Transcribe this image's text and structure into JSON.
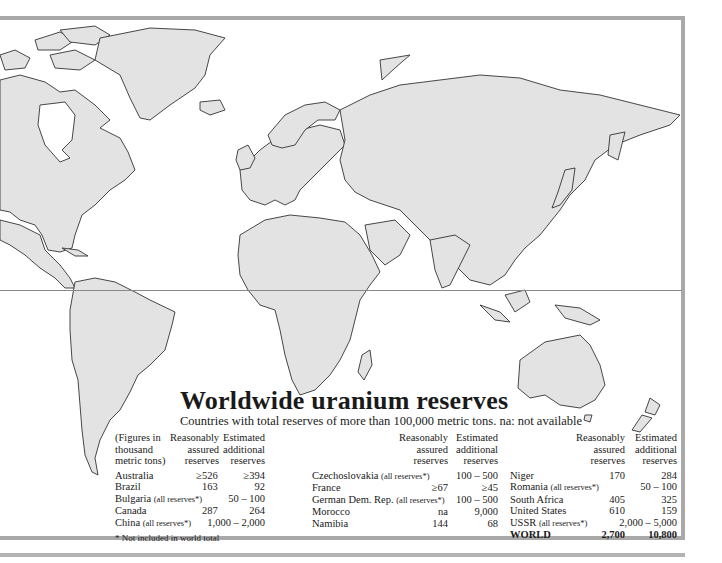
{
  "map": {
    "title": "Worldwide uranium reserves",
    "subtitle": "Countries with total reserves of more than 100,000 metric tons. na: not available",
    "fill_color": "#e3e3e3",
    "border_color": "#333333",
    "frame_color": "#a9a9a9"
  },
  "table": {
    "units_note": [
      "(Figures in",
      "thousand",
      "metric tons)"
    ],
    "col_headers": {
      "assured": [
        "Reasonably",
        "assured",
        "reserves"
      ],
      "additional": [
        "Estimated",
        "additional",
        "reserves"
      ]
    },
    "groups": [
      {
        "rows": [
          {
            "country": "Australia",
            "note": "",
            "assured": "≥526",
            "additional": "≥394"
          },
          {
            "country": "Brazil",
            "note": "",
            "assured": "163",
            "additional": "92"
          },
          {
            "country": "Bulgaria",
            "note": "(all reserves*)",
            "assured": "",
            "additional": "50 – 100"
          },
          {
            "country": "Canada",
            "note": "",
            "assured": "287",
            "additional": "264"
          },
          {
            "country": "China",
            "note": "(all reserves*)",
            "assured": "",
            "additional": "1,000 – 2,000"
          }
        ]
      },
      {
        "rows": [
          {
            "country": "Czechoslovakia",
            "note": "(all reserves*)",
            "assured": "",
            "additional": "100 – 500"
          },
          {
            "country": "France",
            "note": "",
            "assured": "≥67",
            "additional": "≥45"
          },
          {
            "country": "German Dem. Rep.",
            "note": "(all reserves*)",
            "assured": "",
            "additional": "100 – 500"
          },
          {
            "country": "Morocco",
            "note": "",
            "assured": "na",
            "additional": "9,000"
          },
          {
            "country": "Namibia",
            "note": "",
            "assured": "144",
            "additional": "68"
          }
        ]
      },
      {
        "rows": [
          {
            "country": "Niger",
            "note": "",
            "assured": "170",
            "additional": "284"
          },
          {
            "country": "Romania",
            "note": "(all reserves*)",
            "assured": "",
            "additional": "50 – 100"
          },
          {
            "country": "South Africa",
            "note": "",
            "assured": "405",
            "additional": "325"
          },
          {
            "country": "United States",
            "note": "",
            "assured": "610",
            "additional": "159"
          },
          {
            "country": "USSR",
            "note": "(all reserves*)",
            "assured": "",
            "additional": "2,000 – 5,000"
          },
          {
            "country": "WORLD",
            "note": "",
            "assured": "2,700",
            "additional": "10,800",
            "bold": true
          }
        ]
      }
    ],
    "footnote": "* Not included in world total"
  }
}
